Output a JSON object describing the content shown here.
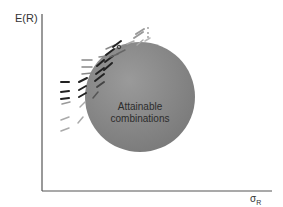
{
  "diagram": {
    "y_axis_label": "E(R)",
    "x_axis_label_main": "σ",
    "x_axis_label_sub": "R",
    "region_label_line1": "Attainable",
    "region_label_line2": "combinations",
    "colors": {
      "region_fill": "#8c8c8c",
      "axis": "#555555",
      "dash_dark": "#222222",
      "dash_mid": "#666666",
      "dash_light": "#aaaaaa",
      "text": "#333333"
    }
  }
}
